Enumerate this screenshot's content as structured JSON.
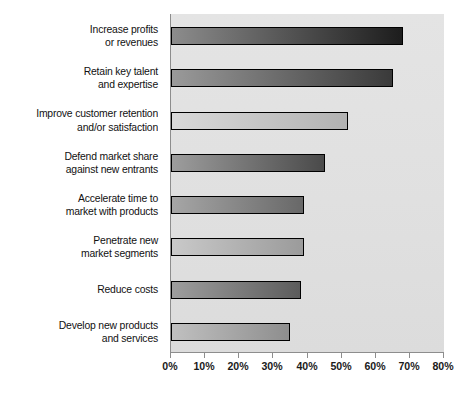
{
  "chart_data": {
    "type": "bar",
    "orientation": "horizontal",
    "title": "",
    "subtitle": "",
    "xlabel": "",
    "ylabel": "",
    "xlim": [
      0,
      80
    ],
    "ylim": null,
    "grid": false,
    "legend": null,
    "xtick_labels": [
      "0%",
      "10%",
      "20%",
      "30%",
      "40%",
      "50%",
      "60%",
      "70%",
      "80%"
    ],
    "xtick_values": [
      0,
      10,
      20,
      30,
      40,
      50,
      60,
      70,
      80
    ],
    "categories": [
      "Increase profits\nor revenues",
      "Retain key talent\nand expertise",
      "Improve customer retention\nand/or satisfaction",
      "Defend market share\nagainst new entrants",
      "Accelerate time to\nmarket with products",
      "Penetrate new\nmarket segments",
      "Reduce costs",
      "Develop new products\nand services"
    ],
    "values": [
      68,
      65,
      52,
      45,
      39,
      39,
      38,
      35
    ],
    "value_unit": "%",
    "bar_colors_start": [
      "#8c8c8c",
      "#9a9a9a",
      "#d9d9d9",
      "#9d9d9d",
      "#a6a6a6",
      "#c9c9c9",
      "#9e9e9e",
      "#c0c0c0"
    ],
    "bar_colors_end": [
      "#1d1d1d",
      "#3a3a3a",
      "#b2b2b2",
      "#4a4a4a",
      "#686868",
      "#9b9b9b",
      "#5c5c5c",
      "#8e8e8e"
    ],
    "plot_background": "#e2e2e2",
    "axis_color": "#8d8d8d",
    "bar_border_color": "#000000"
  }
}
